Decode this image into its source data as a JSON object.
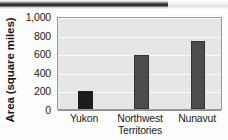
{
  "chart_data": {
    "type": "bar",
    "title": "",
    "xlabel": "",
    "ylabel": "Area (square miles)",
    "categories": [
      "Yukon",
      "Northwest Territories",
      "Nunavut"
    ],
    "category_lines": [
      [
        "Yukon"
      ],
      [
        "Northwest",
        "Territories"
      ],
      [
        "Nunavut"
      ]
    ],
    "values": [
      190,
      580,
      730
    ],
    "ylim": [
      0,
      1000
    ],
    "yticks": [
      0,
      200,
      400,
      600,
      800,
      1000
    ],
    "ytick_labels": [
      "0",
      "200",
      "400",
      "600",
      "800",
      "1,000"
    ],
    "grid": true,
    "legend": false,
    "bar_colors": [
      "#1d1d1d",
      "#4c4c4c",
      "#4c4c4c"
    ],
    "plot_background": "#e6e6e6",
    "gridline_color": "#fafafa",
    "axis_color": "#8e8e8e"
  },
  "figure": {
    "scan_artifact": "dark-scan-band"
  }
}
